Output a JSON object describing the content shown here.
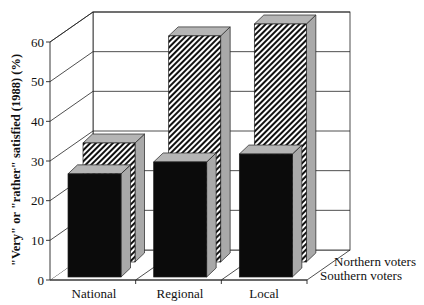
{
  "chart_data": {
    "type": "bar",
    "style": "3d-clustered-depth",
    "title": "",
    "xlabel": "",
    "ylabel": "\"Very\" or \"rather\" satisfied (1988) (%)",
    "categories": [
      "National",
      "Regional",
      "Local"
    ],
    "series": [
      {
        "name": "Southern voters",
        "row": "front",
        "pattern": "solid-black",
        "values": [
          26,
          29,
          31
        ]
      },
      {
        "name": "Northern voters",
        "row": "back",
        "pattern": "diagonal-hatch",
        "values": [
          30,
          57,
          60
        ]
      }
    ],
    "ylim": [
      0,
      60
    ],
    "yticks": [
      0,
      10,
      20,
      30,
      40,
      50,
      60
    ],
    "grid": true,
    "legend": "bottom-right (depth axis labels)",
    "legend_entries": [
      "Northern voters",
      "Southern voters"
    ]
  }
}
